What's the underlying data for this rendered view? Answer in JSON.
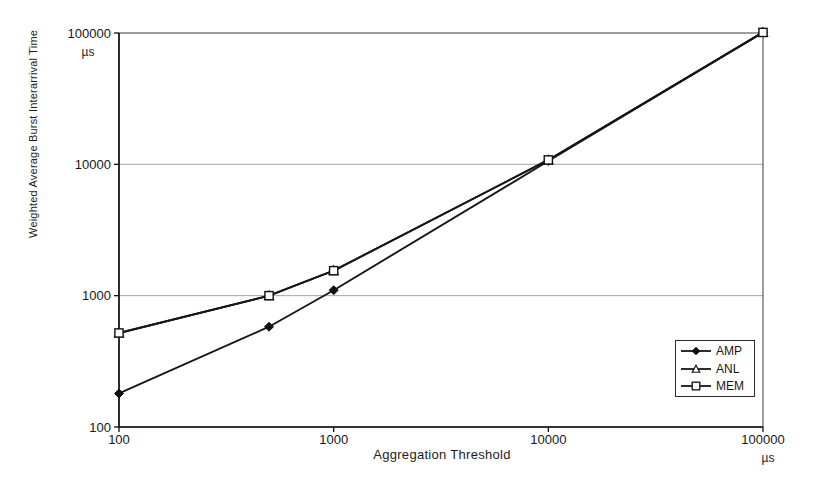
{
  "chart_data": {
    "type": "line",
    "title": "",
    "xlabel": "Aggregation Threshold",
    "ylabel": "Weighted Average Burst Interarrival Time",
    "x_unit": "µs",
    "y_unit": "µs",
    "x_scale": "log",
    "y_scale": "log",
    "xlim": [
      100,
      100000
    ],
    "ylim": [
      100,
      100000
    ],
    "x_ticks": [
      "100",
      "1000",
      "10000",
      "100000"
    ],
    "y_ticks": [
      "100",
      "1000",
      "10000",
      "100000"
    ],
    "grid": "horizontal-gridlines at 1000 and 10000",
    "legend_position": "lower-right",
    "x": [
      100,
      500,
      1000,
      10000,
      100000
    ],
    "series": [
      {
        "name": "AMP",
        "marker": "filled-diamond",
        "values": [
          180,
          580,
          1100,
          10600,
          101000
        ]
      },
      {
        "name": "ANL",
        "marker": "open-triangle",
        "values": [
          520,
          1000,
          1550,
          10800,
          101000
        ]
      },
      {
        "name": "MEM",
        "marker": "open-square",
        "values": [
          520,
          1000,
          1550,
          10800,
          101000
        ]
      }
    ],
    "line_color": "#161616",
    "grid_color": "#9a9a9a",
    "note": "ANL and MEM curves coincide; triangles hidden behind squares"
  }
}
